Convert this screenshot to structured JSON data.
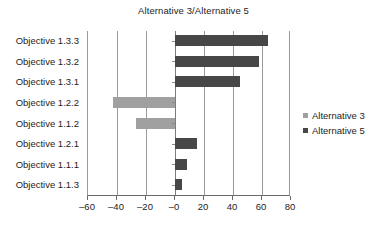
{
  "chart_data": {
    "type": "bar",
    "orientation": "horizontal",
    "title": "Alternative 3/Alternative 5",
    "xlabel": "",
    "ylabel": "",
    "xlim": [
      -60,
      80
    ],
    "ylim": null,
    "grid": true,
    "legend_position": "right",
    "categories": [
      "Objective 1.3.3",
      "Objective 1.3.2",
      "Objective 1.3.1",
      "Objective 1.2.2",
      "Objective 1.1.2",
      "Objective 1.2.1",
      "Objective 1.1.1",
      "Objective 1.1.3"
    ],
    "values": [
      64,
      58,
      45,
      -43,
      -27,
      15,
      8,
      5
    ],
    "xticks": [
      -60,
      -40,
      -20,
      0,
      20,
      40,
      60,
      80
    ],
    "xticklabels": [
      "–60",
      "–40",
      "–20",
      "–0",
      "20",
      "40",
      "60",
      "80"
    ],
    "series": [
      {
        "name": "Alternative 3",
        "color": "#a0a0a0",
        "applies_to": "negative"
      },
      {
        "name": "Alternative 5",
        "color": "#474747",
        "applies_to": "positive"
      }
    ],
    "bars": [
      {
        "category": "Objective 1.3.3",
        "value": 64,
        "series": "Alternative 5",
        "color": "#474747"
      },
      {
        "category": "Objective 1.3.2",
        "value": 58,
        "series": "Alternative 5",
        "color": "#474747"
      },
      {
        "category": "Objective 1.3.1",
        "value": 45,
        "series": "Alternative 5",
        "color": "#474747"
      },
      {
        "category": "Objective 1.2.2",
        "value": -43,
        "series": "Alternative 3",
        "color": "#a0a0a0"
      },
      {
        "category": "Objective 1.1.2",
        "value": -27,
        "series": "Alternative 3",
        "color": "#a0a0a0"
      },
      {
        "category": "Objective 1.2.1",
        "value": 15,
        "series": "Alternative 5",
        "color": "#474747"
      },
      {
        "category": "Objective 1.1.1",
        "value": 8,
        "series": "Alternative 5",
        "color": "#474747"
      },
      {
        "category": "Objective 1.1.3",
        "value": 5,
        "series": "Alternative 5",
        "color": "#474747"
      }
    ]
  },
  "legend": {
    "items": [
      {
        "label": "Alternative 3",
        "color": "#a0a0a0"
      },
      {
        "label": "Alternative 5",
        "color": "#474747"
      }
    ]
  }
}
